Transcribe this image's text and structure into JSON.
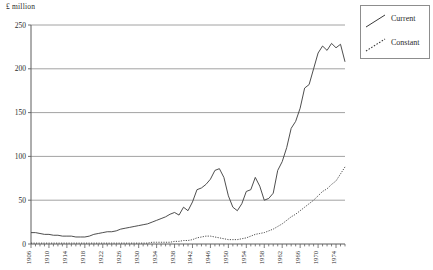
{
  "chart_data": {
    "type": "line",
    "title": "",
    "subtitle": "",
    "ylabel": "£ million",
    "xlabel": "",
    "ylim": [
      0,
      250
    ],
    "yticks": [
      0,
      50,
      100,
      150,
      200,
      250
    ],
    "ytick_labels": [
      "0",
      "50",
      "100",
      "150",
      "200",
      "250"
    ],
    "xlim": [
      1906,
      1976
    ],
    "xtick_labels": [
      "1906",
      "1910",
      "1914",
      "1918",
      "1922",
      "1926",
      "1930",
      "1934",
      "1938",
      "1942",
      "1946",
      "1950",
      "1954",
      "1958",
      "1962",
      "1966",
      "1970",
      "1974"
    ],
    "xtick_step_years": 4,
    "minor_tick_step_years": 1,
    "grid": "horizontal",
    "legend_position": "outside-top-right",
    "legend": [
      "Current",
      "Constant"
    ],
    "x": [
      1906,
      1907,
      1908,
      1909,
      1910,
      1911,
      1912,
      1913,
      1914,
      1915,
      1916,
      1917,
      1918,
      1919,
      1920,
      1921,
      1922,
      1923,
      1924,
      1925,
      1926,
      1927,
      1928,
      1929,
      1930,
      1931,
      1932,
      1933,
      1934,
      1935,
      1936,
      1937,
      1938,
      1939,
      1940,
      1941,
      1942,
      1943,
      1944,
      1945,
      1946,
      1947,
      1948,
      1949,
      1950,
      1951,
      1952,
      1953,
      1954,
      1955,
      1956,
      1957,
      1958,
      1959,
      1960,
      1961,
      1962,
      1963,
      1964,
      1965,
      1966,
      1967,
      1968,
      1969,
      1970,
      1971,
      1972,
      1973,
      1974,
      1975,
      1976
    ],
    "series": [
      {
        "name": "Current",
        "style": "solid",
        "color": "#3a3a3a",
        "values": [
          13,
          13,
          12,
          12,
          12,
          11,
          11,
          10,
          10,
          10,
          9,
          8,
          8,
          9,
          11,
          12,
          13,
          14,
          14,
          15,
          16,
          17,
          18,
          19,
          20,
          20,
          21,
          22,
          24,
          25,
          27,
          29,
          31,
          30,
          36,
          33,
          40,
          52,
          53,
          58,
          65,
          80,
          84,
          78,
          68,
          55,
          42,
          38,
          43,
          56,
          64,
          59,
          45,
          48,
          50,
          54,
          63,
          62,
          65,
          68,
          72,
          68,
          69,
          72,
          74,
          78,
          80,
          85,
          84,
          88,
          90
        ]
      },
      {
        "name": "Constant",
        "style": "dotted",
        "color": "#3a3a3a",
        "values": [
          2,
          2,
          2,
          2,
          2,
          2,
          2,
          2,
          2,
          2,
          2,
          2,
          2,
          2,
          2,
          2,
          2,
          2,
          2,
          2,
          2,
          2,
          2,
          2,
          2,
          2,
          2,
          2,
          2,
          2,
          2,
          2,
          3,
          3,
          4,
          4,
          5,
          6,
          6,
          6,
          6,
          6,
          5,
          5,
          5,
          5,
          5,
          5,
          6,
          7,
          8,
          9,
          10,
          11,
          12,
          14,
          16,
          18,
          20,
          22,
          25,
          27,
          29,
          31,
          34,
          36,
          39,
          42,
          46,
          50,
          54
        ]
      }
    ],
    "current_actual": [
      13,
      13,
      12,
      12,
      12,
      11,
      11,
      10,
      10,
      10,
      9,
      8,
      8,
      9,
      11,
      12,
      13,
      14,
      14,
      15,
      16,
      17,
      18,
      19,
      20,
      21,
      22,
      23,
      25,
      27,
      29,
      31,
      33,
      32,
      38,
      35,
      43,
      56,
      57,
      62,
      70,
      86,
      90,
      84,
      73,
      59,
      45,
      41,
      46,
      60,
      69,
      63,
      48,
      51,
      54,
      58,
      68,
      67,
      70,
      73,
      78,
      73,
      74,
      78,
      80,
      84,
      86,
      92,
      90,
      95,
      97
    ]
  },
  "current_series_points": {
    "years": [
      1906,
      1907,
      1908,
      1909,
      1910,
      1911,
      1912,
      1913,
      1914,
      1915,
      1916,
      1917,
      1918,
      1919,
      1920,
      1921,
      1922,
      1923,
      1924,
      1925,
      1926,
      1927,
      1928,
      1929,
      1930,
      1931,
      1932,
      1933,
      1934,
      1935,
      1936,
      1937,
      1938,
      1939,
      1940,
      1941,
      1942,
      1943,
      1944,
      1945,
      1946,
      1947,
      1948,
      1949,
      1950,
      1951,
      1952,
      1953,
      1954,
      1955,
      1956,
      1957,
      1958,
      1959,
      1960,
      1961,
      1962,
      1963,
      1964,
      1965,
      1966,
      1967,
      1968,
      1969,
      1970,
      1971,
      1972,
      1973,
      1974,
      1975,
      1976
    ],
    "values": [
      13,
      13,
      12,
      11,
      11,
      10,
      10,
      9,
      9,
      9,
      8,
      8,
      8,
      9,
      11,
      12,
      13,
      14,
      14,
      15,
      17,
      18,
      19,
      20,
      21,
      22,
      23,
      25,
      27,
      29,
      31,
      34,
      36,
      33,
      42,
      38,
      48,
      62,
      64,
      68,
      74,
      84,
      86,
      76,
      55,
      42,
      38,
      46,
      60,
      62,
      76,
      66,
      50,
      52,
      58,
      84,
      94,
      110,
      132,
      140,
      155,
      178,
      182,
      200,
      218,
      226,
      221,
      229,
      224,
      228,
      208
    ]
  },
  "constant_series_points": {
    "years": [
      1906,
      1907,
      1908,
      1909,
      1910,
      1911,
      1912,
      1913,
      1914,
      1915,
      1916,
      1917,
      1918,
      1919,
      1920,
      1921,
      1922,
      1923,
      1924,
      1925,
      1926,
      1927,
      1928,
      1929,
      1930,
      1931,
      1932,
      1933,
      1934,
      1935,
      1936,
      1937,
      1938,
      1939,
      1940,
      1941,
      1942,
      1943,
      1944,
      1945,
      1946,
      1947,
      1948,
      1949,
      1950,
      1951,
      1952,
      1953,
      1954,
      1955,
      1956,
      1957,
      1958,
      1959,
      1960,
      1961,
      1962,
      1963,
      1964,
      1965,
      1966,
      1967,
      1968,
      1969,
      1970,
      1971,
      1972,
      1973,
      1974,
      1975,
      1976
    ],
    "values": [
      1,
      1,
      1,
      1,
      1,
      1,
      1,
      1,
      1,
      1,
      1,
      1,
      1,
      1,
      1,
      1,
      1,
      1,
      1,
      1,
      1,
      1,
      1,
      1,
      1,
      1,
      1,
      2,
      2,
      2,
      2,
      2,
      3,
      3,
      4,
      4,
      5,
      7,
      8,
      9,
      9,
      8,
      7,
      6,
      5,
      5,
      5,
      6,
      7,
      9,
      11,
      12,
      13,
      15,
      17,
      20,
      23,
      27,
      31,
      34,
      38,
      42,
      46,
      50,
      55,
      60,
      63,
      68,
      72,
      80,
      88
    ]
  },
  "legend": {
    "items": [
      {
        "label": "Current",
        "style": "solid"
      },
      {
        "label": "Constant",
        "style": "dotted"
      }
    ]
  },
  "axis": {
    "unit_label": "£ million"
  }
}
